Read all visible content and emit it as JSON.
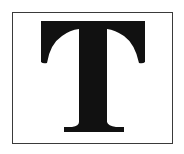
{
  "figure": {
    "letter": "T",
    "colors": {
      "background": "#ffffff",
      "frame": "#3a3a3a",
      "glyph": "#111111"
    }
  }
}
